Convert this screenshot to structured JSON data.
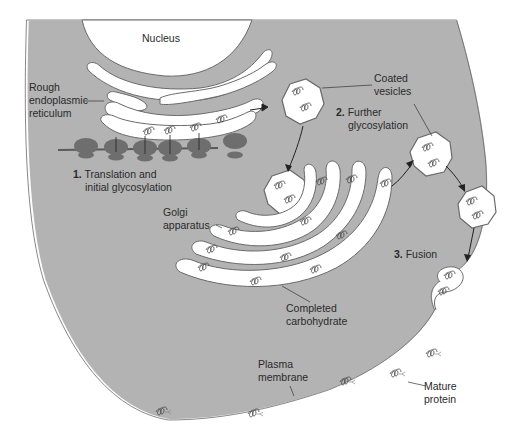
{
  "colors": {
    "cytoplasm": "#b3b3b3",
    "membrane_outline": "#6a6a6a",
    "lumen": "#ffffff",
    "ribosome": "#6e6e6e",
    "text": "#2a2a2a",
    "background": "#ffffff"
  },
  "labels": {
    "nucleus": "Nucleus",
    "rough_er": [
      "Rough",
      "endoplasmic",
      "reticulum"
    ],
    "coated_vesicles": [
      "Coated",
      "vesicles"
    ],
    "step1": {
      "number": "1.",
      "line1": "Translation and",
      "line2": "initial glycosylation"
    },
    "step2": {
      "number": "2.",
      "line1": "Further",
      "line2": "glycosylation"
    },
    "step3": {
      "number": "3.",
      "line1": "Fusion"
    },
    "golgi": [
      "Golgi",
      "apparatus"
    ],
    "completed_carbohydrate": [
      "Completed",
      "carbohydrate"
    ],
    "plasma_membrane": [
      "Plasma",
      "membrane"
    ],
    "mature_protein": [
      "Mature",
      "protein"
    ]
  }
}
